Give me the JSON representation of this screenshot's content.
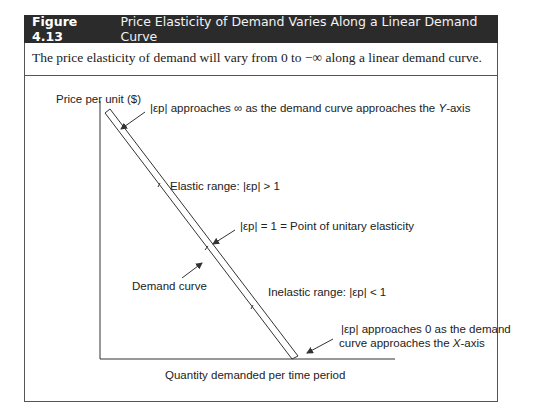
{
  "figure": {
    "number": "Figure 4.13",
    "title": "Price Elasticity of Demand Varies Along a Linear Demand Curve",
    "caption": "The price elasticity of demand will vary from 0 to −∞ along a linear demand curve."
  },
  "axes": {
    "y_label": "Price per unit ($)",
    "x_label": "Quantity demanded per time period"
  },
  "annotations": {
    "top": {
      "symbol": "|εp|",
      "text_a": "approaches ∞ as the demand curve approaches the ",
      "axis": "Y",
      "text_b": "-axis"
    },
    "elastic": {
      "prefix": "Elastic range:",
      "symbol": "|εp|",
      "suffix": "> 1"
    },
    "unitary": {
      "symbol": "|εp|",
      "suffix": "= 1 = Point of unitary elasticity"
    },
    "curve": {
      "label": "Demand curve"
    },
    "inelastic": {
      "prefix": "Inelastic range:",
      "symbol": "|εp|",
      "suffix": "< 1"
    },
    "bottom": {
      "symbol": "|εp|",
      "line1": "approaches 0 as the demand",
      "line2a": "curve approaches the ",
      "axis": "X",
      "line2b": "-axis"
    }
  },
  "colors": {
    "header_bg": "#2b2b2b",
    "header_text": "#ffffff",
    "line": "#333333",
    "border": "#555555"
  }
}
